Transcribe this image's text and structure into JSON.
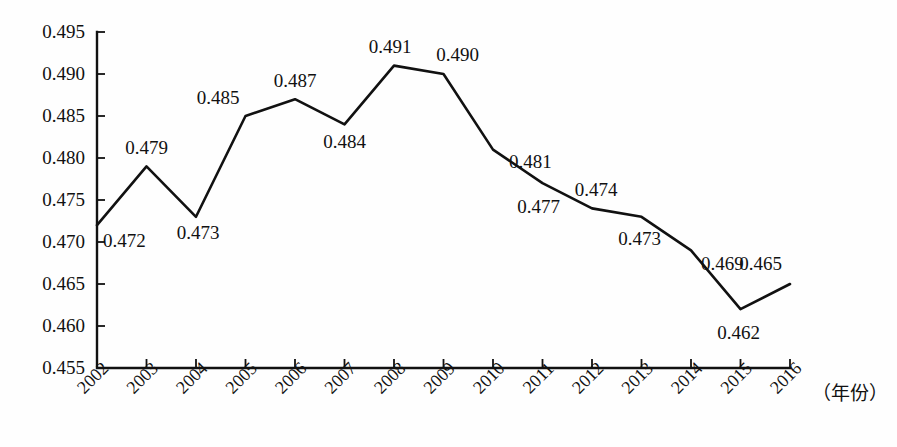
{
  "chart_data": {
    "type": "line",
    "title": "",
    "subtitle": "",
    "xlabel": "（年份）",
    "ylabel": "",
    "categories": [
      "2002",
      "2003",
      "2004",
      "2005",
      "2006",
      "2007",
      "2008",
      "2009",
      "2010",
      "2011",
      "2012",
      "2013",
      "2014",
      "2015",
      "2016"
    ],
    "values": [
      0.472,
      0.479,
      0.473,
      0.485,
      0.487,
      0.484,
      0.491,
      0.49,
      0.481,
      0.477,
      0.474,
      0.473,
      0.469,
      0.462,
      0.465
    ],
    "point_labels": [
      "0.472",
      "0.479",
      "0.473",
      "0.485",
      "0.487",
      "0.484",
      "0.491",
      "0.490",
      "0.481",
      "0.477",
      "0.474",
      "0.473",
      "0.469",
      "0.462",
      "0.465"
    ],
    "ylim": [
      0.455,
      0.495
    ],
    "ytick_values": [
      0.455,
      0.46,
      0.465,
      0.47,
      0.475,
      0.48,
      0.485,
      0.49,
      0.495
    ],
    "ytick_labels": [
      "0.455",
      "0.460",
      "0.465",
      "0.470",
      "0.475",
      "0.480",
      "0.485",
      "0.490",
      "0.495"
    ],
    "xtick_labels": [
      "2002",
      "2003",
      "2004",
      "2005",
      "2006",
      "2007",
      "2008",
      "2009",
      "2010",
      "2011",
      "2012",
      "2013",
      "2014",
      "2015",
      "2016"
    ],
    "grid": false,
    "legend": false,
    "legend_position": "none",
    "series_color": "#111111",
    "background_color": "#fefefe",
    "markers": false
  },
  "axis": {
    "x_axis_caption": "（年份）"
  }
}
